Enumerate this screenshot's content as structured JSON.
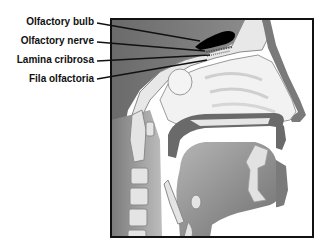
{
  "diagram": {
    "type": "anatomical-sagittal-section",
    "labels": [
      {
        "id": "olfactory-bulb",
        "text": "Olfactory bulb",
        "text_right_x": 94,
        "text_y": 22,
        "line_from": [
          97,
          23
        ],
        "line_to": [
          200,
          41
        ]
      },
      {
        "id": "olfactory-nerve",
        "text": "Olfactory nerve",
        "text_right_x": 94,
        "text_y": 40,
        "line_from": [
          97,
          42
        ],
        "line_to": [
          205,
          51
        ]
      },
      {
        "id": "lamina-cribrosa",
        "text": "Lamina cribrosa",
        "text_right_x": 94,
        "text_y": 58,
        "line_from": [
          97,
          61
        ],
        "line_to": [
          210,
          56
        ]
      },
      {
        "id": "fila-olfactoria",
        "text": "Fila olfactoria",
        "text_right_x": 94,
        "text_y": 76,
        "line_from": [
          97,
          79
        ],
        "line_to": [
          207,
          62
        ]
      }
    ],
    "frame": {
      "x": 110,
      "y": 18,
      "width": 204,
      "height": 220
    },
    "colors": {
      "dark_tissue": "#5a5a5a",
      "mid_tissue": "#8c8c8c",
      "light_tissue": "#d8d8d8",
      "bone": "#e6e6e6",
      "bulb": "#000000",
      "frame": "#111111",
      "background": "#ffffff"
    }
  }
}
